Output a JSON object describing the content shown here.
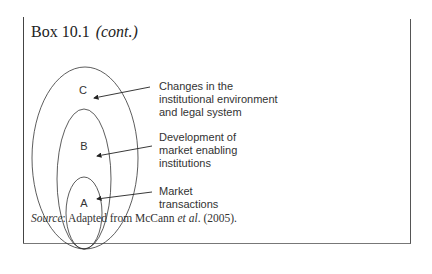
{
  "box": {
    "title": "Box 10.1",
    "title_suffix": "(cont.)"
  },
  "diagram": {
    "circles": [
      {
        "id": "C",
        "label": "C",
        "description": [
          "Changes in the",
          "institutional environment",
          "and legal system"
        ]
      },
      {
        "id": "B",
        "label": "B",
        "description": [
          "Development of",
          "market enabling",
          "institutions"
        ]
      },
      {
        "id": "A",
        "label": "A",
        "description": [
          "Market",
          "transactions"
        ]
      }
    ]
  },
  "source": {
    "prefix": "Source",
    "text_before": ": Adapted from McCann ",
    "etal": "et al",
    "text_after": ". (2005)."
  }
}
